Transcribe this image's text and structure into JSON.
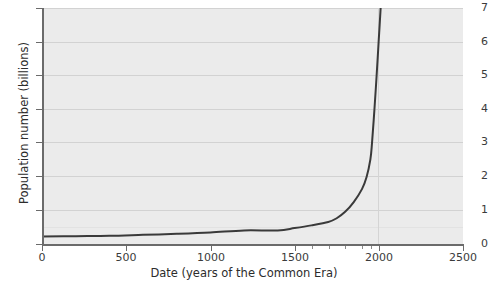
{
  "chart_data": {
    "type": "line",
    "title": "",
    "xlabel": "Date (years of the Common Era)",
    "ylabel": "Population number (billions)",
    "xlim": [
      0,
      2500
    ],
    "ylim": [
      0,
      7
    ],
    "grid": true,
    "legend": "none",
    "x_ticks": [
      0,
      500,
      1000,
      1500,
      2000,
      2500
    ],
    "x_ticklabels": [
      "0",
      "500",
      "1000",
      "1500",
      "2000",
      "2500"
    ],
    "x_minor_ticks": [
      1600,
      1700,
      1800,
      1900,
      1950,
      2000
    ],
    "y_ticks": [
      0,
      1,
      2,
      3,
      4,
      5,
      6,
      7
    ],
    "y_ticklabels": [
      "0",
      "1",
      "2",
      "3",
      "4",
      "5",
      "6",
      "7"
    ],
    "y_minor_gridlines": [
      0.5
    ],
    "series": [
      {
        "name": "World population",
        "x": [
          0,
          200,
          400,
          600,
          800,
          1000,
          1200,
          1400,
          1500,
          1600,
          1700,
          1750,
          1800,
          1850,
          1900,
          1927,
          1950,
          1960,
          1974,
          1987,
          1999,
          2011,
          2024,
          2045
        ],
        "values": [
          0.25,
          0.26,
          0.27,
          0.3,
          0.33,
          0.37,
          0.43,
          0.43,
          0.5,
          0.58,
          0.68,
          0.79,
          0.98,
          1.26,
          1.65,
          2.0,
          2.53,
          3.03,
          4.0,
          5.0,
          6.0,
          7.0,
          8.0,
          9.0
        ],
        "color": "#3a3a3a",
        "linewidth": 2
      }
    ],
    "colors": {
      "plot_background": "#ebebeb",
      "figure_background": "#ffffff",
      "gridline": "#d2d2d2",
      "gridline_minor": "#e2e2e2",
      "axis": "#6b6b6b",
      "text": "#2c2c2c",
      "curve": "#3a3a3a"
    }
  }
}
